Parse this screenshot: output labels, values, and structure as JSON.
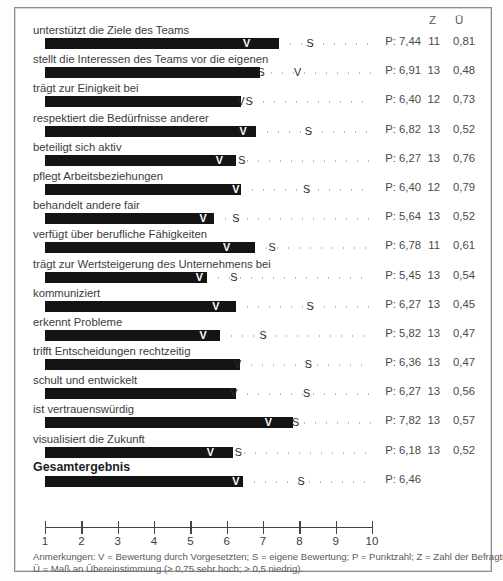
{
  "columns": {
    "z_header": "Z",
    "u_header": "Ü"
  },
  "axis": {
    "ticks": [
      1,
      2,
      3,
      4,
      5,
      6,
      7,
      8,
      9,
      10
    ],
    "min": 1,
    "max": 10
  },
  "note": {
    "line1": "Anmerkungen: V = Bewertung durch Vorgesetzten; S = eigene Bewertung; P = Punktzahl; Z = Zahl der Befragten;",
    "line2": "Ü = Maß an Übereinstimmung (> 0,75 sehr hoch; > 0,5 niedrig)."
  },
  "chart_data": {
    "type": "bar",
    "title": "",
    "xlabel": "",
    "ylabel": "",
    "xlim": [
      1,
      10
    ],
    "grid": false,
    "legend": [
      "V = Bewertung durch Vorgesetzten",
      "S = eigene Bewertung",
      "P = Punktzahl",
      "Z = Zahl der Befragten",
      "Ü = Maß an Übereinstimmung"
    ],
    "categories": [
      "unterstützt die Ziele des Teams",
      "stellt die Interessen des Teams vor die eigenen",
      "trägt zur Einigkeit bei",
      "respektiert die Bedürfnisse anderer",
      "beteiligt sich aktiv",
      "pflegt Arbeitsbeziehungen",
      "behandelt andere fair",
      "verfügt über berufliche Fähigkeiten",
      "trägt zur Wertsteigerung des Unternehmens bei",
      "kommuniziert",
      "erkennt Probleme",
      "trifft Entscheidungen rechtzeitig",
      "schult und entwickelt",
      "ist vertrauenswürdig",
      "visualisiert die Zukunft",
      "Gesamtergebnis"
    ],
    "series": [
      {
        "name": "P",
        "values": [
          7.44,
          6.91,
          6.4,
          6.82,
          6.27,
          6.4,
          5.64,
          6.78,
          5.45,
          6.27,
          5.82,
          6.36,
          6.27,
          7.82,
          6.18,
          6.46
        ]
      },
      {
        "name": "V",
        "values": [
          6.55,
          7.95,
          6.4,
          6.45,
          5.8,
          6.25,
          5.35,
          6.0,
          5.25,
          5.7,
          5.35,
          6.3,
          6.2,
          7.15,
          5.55,
          6.25
        ]
      },
      {
        "name": "S",
        "values": [
          8.3,
          6.95,
          6.55,
          8.25,
          6.4,
          8.2,
          6.25,
          7.25,
          6.2,
          8.3,
          7.0,
          8.25,
          8.2,
          7.9,
          6.3,
          8.05
        ]
      },
      {
        "name": "Z",
        "values": [
          11,
          13,
          12,
          13,
          13,
          12,
          13,
          11,
          13,
          13,
          13,
          13,
          13,
          13,
          13,
          null
        ]
      },
      {
        "name": "Ü",
        "values": [
          0.81,
          0.48,
          0.73,
          0.52,
          0.76,
          0.79,
          0.52,
          0.61,
          0.54,
          0.45,
          0.47,
          0.47,
          0.56,
          0.57,
          0.52,
          null
        ]
      }
    ]
  },
  "rows": [
    {
      "label": "unterstützt die Ziele des Teams",
      "p": 7.44,
      "v": 6.55,
      "s": 8.3,
      "p_text": "P: 7,44",
      "z_text": "11",
      "u_text": "0,81",
      "bold": false
    },
    {
      "label": "stellt die Interessen des Teams vor die eigenen",
      "p": 6.91,
      "v": 7.95,
      "s": 6.95,
      "p_text": "P: 6,91",
      "z_text": "13",
      "u_text": "0,48",
      "bold": false
    },
    {
      "label": "trägt zur Einigkeit bei",
      "p": 6.4,
      "v": 6.4,
      "s": 6.62,
      "p_text": "P: 6,40",
      "z_text": "12",
      "u_text": "0,73",
      "bold": false
    },
    {
      "label": "respektiert die Bedürfnisse anderer",
      "p": 6.82,
      "v": 6.45,
      "s": 8.25,
      "p_text": "P: 6,82",
      "z_text": "13",
      "u_text": "0,52",
      "bold": false
    },
    {
      "label": "beteiligt sich aktiv",
      "p": 6.27,
      "v": 5.8,
      "s": 6.42,
      "p_text": "P: 6,27",
      "z_text": "13",
      "u_text": "0,76",
      "bold": false
    },
    {
      "label": "pflegt Arbeitsbeziehungen",
      "p": 6.4,
      "v": 6.25,
      "s": 8.2,
      "p_text": "P: 6,40",
      "z_text": "12",
      "u_text": "0,79",
      "bold": false
    },
    {
      "label": "behandelt andere fair",
      "p": 5.64,
      "v": 5.35,
      "s": 6.25,
      "p_text": "P: 5,64",
      "z_text": "13",
      "u_text": "0,52",
      "bold": false
    },
    {
      "label": "verfügt über berufliche Fähigkeiten",
      "p": 6.78,
      "v": 6.0,
      "s": 7.25,
      "p_text": "P: 6,78",
      "z_text": "11",
      "u_text": "0,61",
      "bold": false
    },
    {
      "label": "trägt zur Wertsteigerung des Unternehmens bei",
      "p": 5.45,
      "v": 5.25,
      "s": 6.2,
      "p_text": "P: 5,45",
      "z_text": "13",
      "u_text": "0,54",
      "bold": false
    },
    {
      "label": "kommuniziert",
      "p": 6.27,
      "v": 5.7,
      "s": 8.3,
      "p_text": "P: 6,27",
      "z_text": "13",
      "u_text": "0,45",
      "bold": false
    },
    {
      "label": "erkennt Probleme",
      "p": 5.82,
      "v": 5.35,
      "s": 7.0,
      "p_text": "P: 5,82",
      "z_text": "13",
      "u_text": "0,47",
      "bold": false
    },
    {
      "label": "trifft Entscheidungen rechtzeitig",
      "p": 6.36,
      "v": 6.3,
      "s": 8.25,
      "p_text": "P: 6,36",
      "z_text": "13",
      "u_text": "0,47",
      "bold": false
    },
    {
      "label": "schult und entwickelt",
      "p": 6.27,
      "v": 6.2,
      "s": 8.2,
      "p_text": "P: 6,27",
      "z_text": "13",
      "u_text": "0,56",
      "bold": false
    },
    {
      "label": "ist vertrauenswürdig",
      "p": 7.82,
      "v": 7.15,
      "s": 7.9,
      "p_text": "P: 7,82",
      "z_text": "13",
      "u_text": "0,57",
      "bold": false
    },
    {
      "label": "visualisiert die Zukunft",
      "p": 6.18,
      "v": 5.55,
      "s": 6.32,
      "p_text": "P: 6,18",
      "z_text": "13",
      "u_text": "0,52",
      "bold": false
    },
    {
      "label": "Gesamtergebnis",
      "p": 6.46,
      "v": 6.25,
      "s": 8.05,
      "p_text": "P: 6,46",
      "z_text": "",
      "u_text": "",
      "bold": true
    }
  ]
}
